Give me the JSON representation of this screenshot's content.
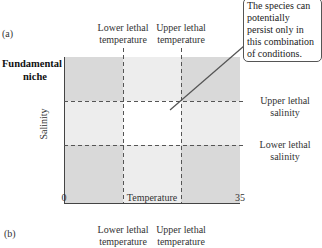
{
  "panel_a": {
    "label": "(a)",
    "title": "Fundamental niche",
    "title_lines": [
      "Fundamental",
      "niche"
    ],
    "y_axis_label": "Salinity",
    "x_axis_label": "Temperature",
    "x_min": "0",
    "x_max": "35",
    "lower_lethal_temperature": [
      "Lower lethal",
      "temperature"
    ],
    "upper_lethal_temperature": [
      "Upper lethal",
      "temperature"
    ],
    "upper_lethal_salinity": [
      "Upper lethal",
      "salinity"
    ],
    "lower_lethal_salinity": [
      "Lower lethal",
      "salinity"
    ],
    "callout": [
      "The species can",
      "potentially",
      "persist only in",
      "this combination",
      "of conditions."
    ]
  },
  "panel_b": {
    "label": "(b)",
    "lower_lethal_temperature": [
      "Lower lethal",
      "temperature"
    ],
    "upper_lethal_temperature": [
      "Upper lethal",
      "temperature"
    ]
  },
  "colors": {
    "corner": "#d9d9d9",
    "edge": "#ededed",
    "center": "#ffffff",
    "dash": "#555555"
  }
}
